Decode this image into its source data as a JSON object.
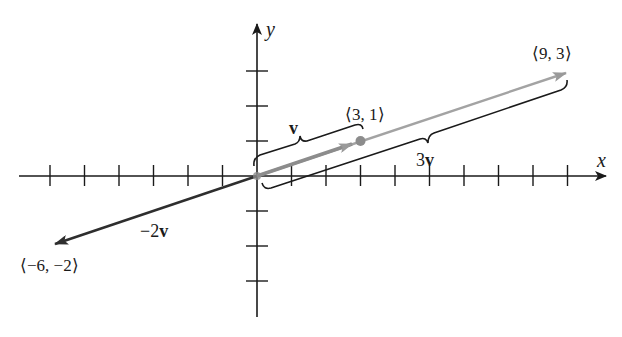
{
  "diagram": {
    "type": "vector-scalar-multiplication",
    "axes": {
      "x_label": "x",
      "y_label": "y",
      "x_ticks": [
        -6,
        -5,
        -4,
        -3,
        -2,
        -1,
        1,
        2,
        3,
        4,
        5,
        6,
        7,
        8,
        9
      ],
      "y_ticks": [
        -4,
        -3,
        -2,
        -1,
        1,
        2,
        3
      ],
      "x_range": [
        -6.8,
        10.3
      ],
      "y_range": [
        -4.0,
        4.4
      ]
    },
    "vectors": [
      {
        "name": "v",
        "label_text": "v",
        "from": [
          0,
          0
        ],
        "to": [
          3,
          1
        ],
        "color": "#8c8c8c"
      },
      {
        "name": "3v",
        "label_prefix": "3",
        "label_text": "v",
        "from": [
          0,
          0
        ],
        "to": [
          9,
          3
        ],
        "color": "#9a9a9a"
      },
      {
        "name": "-2v",
        "label_prefix": "−2",
        "label_text": "v",
        "from": [
          0,
          0
        ],
        "to": [
          -6,
          -2
        ],
        "color": "#2e2e2e"
      }
    ],
    "points": [
      {
        "label": "⟨3, 1⟩",
        "x": 3,
        "y": 1,
        "color": "#8c8c8c"
      },
      {
        "label": "⟨9, 3⟩",
        "x": 9,
        "y": 3
      },
      {
        "label": "⟨−6, −2⟩",
        "x": -6,
        "y": -2
      }
    ],
    "colors": {
      "axis": "#1a1a1a",
      "brace": "#1a1a1a",
      "gray_vector": "#9a9a9a",
      "dark_vector": "#2e2e2e"
    }
  }
}
